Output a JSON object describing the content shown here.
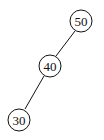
{
  "diagram": {
    "type": "binary-tree",
    "nodes": [
      {
        "id": "n50",
        "label": "50",
        "cx": 81,
        "cy": 21
      },
      {
        "id": "n40",
        "label": "40",
        "cx": 50,
        "cy": 66
      },
      {
        "id": "n30",
        "label": "30",
        "cx": 19,
        "cy": 120
      }
    ],
    "edges": [
      {
        "from": "50",
        "to": "40",
        "side": "left"
      },
      {
        "from": "40",
        "to": "30",
        "side": "left"
      }
    ],
    "colors": {
      "stroke": "#111111",
      "background": "#ffffff"
    }
  }
}
